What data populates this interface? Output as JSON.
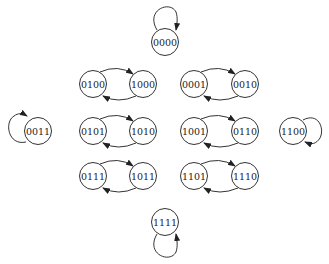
{
  "diagram": {
    "type": "state-transition",
    "nodes": [
      {
        "id": "0000",
        "label": "0000",
        "x": 165,
        "y": 42
      },
      {
        "id": "0100",
        "label": "0100",
        "x": 93,
        "y": 84
      },
      {
        "id": "1000",
        "label": "1000",
        "x": 143,
        "y": 84
      },
      {
        "id": "0001",
        "label": "0001",
        "x": 194,
        "y": 84
      },
      {
        "id": "0010",
        "label": "0010",
        "x": 245,
        "y": 84
      },
      {
        "id": "0011",
        "label": "0011",
        "x": 38,
        "y": 131
      },
      {
        "id": "0101",
        "label": "0101",
        "x": 93,
        "y": 131
      },
      {
        "id": "1010",
        "label": "1010",
        "x": 143,
        "y": 131
      },
      {
        "id": "1001",
        "label": "1001",
        "x": 194,
        "y": 131
      },
      {
        "id": "0110",
        "label": "0110",
        "x": 245,
        "y": 131
      },
      {
        "id": "1100",
        "label": "1100",
        "x": 293,
        "y": 131
      },
      {
        "id": "0111",
        "label": "0111",
        "x": 93,
        "y": 176
      },
      {
        "id": "1011",
        "label": "1011",
        "x": 143,
        "y": 176
      },
      {
        "id": "1101",
        "label": "1101",
        "x": 194,
        "y": 176
      },
      {
        "id": "1110",
        "label": "1110",
        "x": 245,
        "y": 176
      },
      {
        "id": "1111",
        "label": "1111",
        "x": 165,
        "y": 222
      }
    ],
    "edges": [
      {
        "from": "0000",
        "to": "0000",
        "kind": "self-loop-top"
      },
      {
        "from": "0100",
        "to": "1000"
      },
      {
        "from": "1000",
        "to": "0100"
      },
      {
        "from": "0001",
        "to": "0010"
      },
      {
        "from": "0010",
        "to": "0001"
      },
      {
        "from": "0011",
        "to": "0011",
        "kind": "self-loop-left"
      },
      {
        "from": "0101",
        "to": "1010"
      },
      {
        "from": "1010",
        "to": "0101"
      },
      {
        "from": "1001",
        "to": "0110"
      },
      {
        "from": "0110",
        "to": "1001"
      },
      {
        "from": "1100",
        "to": "1100",
        "kind": "self-loop-right"
      },
      {
        "from": "0111",
        "to": "1011"
      },
      {
        "from": "1011",
        "to": "0111"
      },
      {
        "from": "1101",
        "to": "1110"
      },
      {
        "from": "1110",
        "to": "1101"
      },
      {
        "from": "1111",
        "to": "1111",
        "kind": "self-loop-bottom"
      }
    ]
  }
}
